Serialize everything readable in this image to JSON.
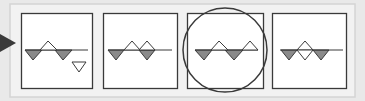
{
  "diagram": {
    "colors": {
      "page_bg": "#e9e9e9",
      "frame_bg": "#f2f2f2",
      "frame_border": "#d4d4d4",
      "panel_bg": "#ffffff",
      "panel_border": "#3a3a3a",
      "line": "#3a3a3a",
      "filled_triangle": "#8a8a8a",
      "hollow_triangle": "#ffffff",
      "highlight_circle": "#3a3a3a",
      "arrow": "#3a3a3a"
    },
    "arrow": {
      "label": "arrow-pointing-right",
      "points": "0,34 0,52 16,43"
    },
    "frame": {
      "x": 10,
      "y": 4,
      "w": 345,
      "h": 93
    },
    "panels": [
      {
        "id": "panel-1",
        "x": 21,
        "y": 13,
        "w": 71,
        "h": 75,
        "baseline": {
          "x1": 25,
          "x2": 88,
          "y": 50
        },
        "triangles": [
          {
            "kind": "down-filled",
            "points": "25,50 42,50 33,60"
          },
          {
            "kind": "up-hollow",
            "points": "40,50 57,50 48,41"
          },
          {
            "kind": "down-filled",
            "points": "55,50 72,50 63,60"
          },
          {
            "kind": "down-hollow-detached",
            "points": "72,62 86,62 79,72"
          }
        ]
      },
      {
        "id": "panel-2",
        "x": 103,
        "y": 13,
        "w": 74,
        "h": 75,
        "baseline": {
          "x1": 108,
          "x2": 172,
          "y": 50
        },
        "triangles": [
          {
            "kind": "down-filled",
            "points": "108,50 124,50 116,60"
          },
          {
            "kind": "up-hollow",
            "points": "124,50 140,50 132,41"
          },
          {
            "kind": "up-hollow",
            "points": "139,50 155,50 147,41"
          },
          {
            "kind": "down-filled",
            "points": "139,50 155,50 147,60"
          }
        ]
      },
      {
        "id": "panel-3",
        "x": 187,
        "y": 13,
        "w": 76,
        "h": 75,
        "highlighted": true,
        "baseline": {
          "x1": 195,
          "x2": 258,
          "y": 50
        },
        "triangles": [
          {
            "kind": "down-filled",
            "points": "195,50 212,50 204,60"
          },
          {
            "kind": "up-hollow",
            "points": "211,50 228,50 219,41"
          },
          {
            "kind": "down-filled",
            "points": "225,50 243,50 234,60"
          },
          {
            "kind": "up-hollow",
            "points": "242,50 258,50 250,41"
          }
        ]
      },
      {
        "id": "panel-4",
        "x": 272,
        "y": 13,
        "w": 74,
        "h": 75,
        "baseline": {
          "x1": 280,
          "x2": 343,
          "y": 50
        },
        "triangles": [
          {
            "kind": "down-filled",
            "points": "281,50 297,50 289,60"
          },
          {
            "kind": "up-hollow",
            "points": "297,50 313,50 305,41"
          },
          {
            "kind": "down-hollow",
            "points": "297,50 313,50 305,60"
          },
          {
            "kind": "down-filled",
            "points": "313,50 329,50 321,60"
          }
        ]
      }
    ],
    "highlight_circle": {
      "cx": 225,
      "cy": 50,
      "r": 42
    }
  }
}
